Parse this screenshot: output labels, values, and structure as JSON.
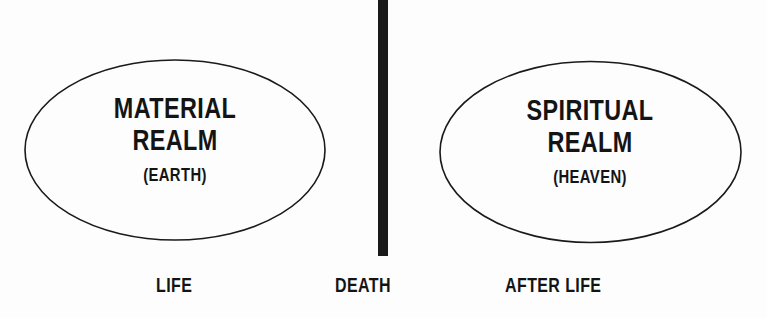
{
  "diagram": {
    "left_realm": {
      "title_line1": "MATERIAL",
      "title_line2": "REALM",
      "subtitle": "(EARTH)"
    },
    "right_realm": {
      "title_line1": "SPIRITUAL",
      "title_line2": "REALM",
      "subtitle": "(HEAVEN)"
    },
    "divider": "death-line",
    "labels": {
      "life": "LIFE",
      "death": "DEATH",
      "after_life": "AFTER LIFE"
    },
    "colors": {
      "ink": "#141414",
      "background": "#fdfdfd"
    }
  }
}
